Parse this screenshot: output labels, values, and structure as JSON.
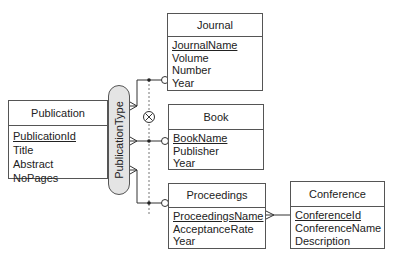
{
  "diagram": {
    "type": "ER diagram (crow's foot notation with disjoint specialization)",
    "entities": {
      "publication": {
        "name": "Publication",
        "attributes": [
          {
            "name": "PublicationId",
            "key": true
          },
          {
            "name": "Title",
            "key": false
          },
          {
            "name": "Abstract",
            "key": false
          },
          {
            "name": "NoPages",
            "key": false
          }
        ]
      },
      "journal": {
        "name": "Journal",
        "attributes": [
          {
            "name": "JournalName",
            "key": true
          },
          {
            "name": "Volume",
            "key": false
          },
          {
            "name": "Number",
            "key": false
          },
          {
            "name": "Year",
            "key": false
          }
        ]
      },
      "book": {
        "name": "Book",
        "attributes": [
          {
            "name": "BookName",
            "key": true
          },
          {
            "name": "Publisher",
            "key": false
          },
          {
            "name": "Year",
            "key": false
          }
        ]
      },
      "proceedings": {
        "name": "Proceedings",
        "attributes": [
          {
            "name": "ProceedingsName",
            "key": true
          },
          {
            "name": "AcceptanceRate",
            "key": false
          },
          {
            "name": "Year",
            "key": false
          }
        ]
      },
      "conference": {
        "name": "Conference",
        "attributes": [
          {
            "name": "ConferenceId",
            "key": true
          },
          {
            "name": "ConferenceName",
            "key": false
          },
          {
            "name": "Description",
            "key": false
          }
        ]
      }
    },
    "discriminator": "PublicationType",
    "disjoint_symbol": "⊗",
    "relationships": [
      {
        "from": "Publication",
        "to": "Journal",
        "via": "PublicationType"
      },
      {
        "from": "Publication",
        "to": "Book",
        "via": "PublicationType"
      },
      {
        "from": "Publication",
        "to": "Proceedings",
        "via": "PublicationType"
      },
      {
        "from": "Proceedings",
        "to": "Conference",
        "cardinality": "many-to-one"
      }
    ]
  }
}
